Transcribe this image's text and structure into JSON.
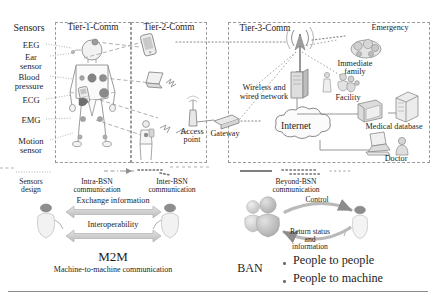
{
  "figure": {
    "regions": [
      {
        "id": "tier1",
        "label": "Tier-1-Comm"
      },
      {
        "id": "tier2",
        "label": "Tier-2-Comm"
      },
      {
        "id": "tier3",
        "label": "Tier-3-Comm"
      }
    ],
    "sensors": {
      "heading": "Sensors",
      "items": [
        {
          "name": "eeg",
          "label": "EEG"
        },
        {
          "name": "ear-sensor",
          "label": "Ear\nsensor"
        },
        {
          "name": "blood-pressure",
          "label": "Blood\npressure"
        },
        {
          "name": "ecg",
          "label": "ECG"
        },
        {
          "name": "emg",
          "label": "EMG"
        },
        {
          "name": "motion-sensor",
          "label": "Motion\nsensor"
        }
      ]
    },
    "nodes": {
      "access_point": "Access\npoint",
      "gateway": "Gateway",
      "wireless_wired_network": "Wireless and\nwired network",
      "internet": "Internet",
      "emergency": "Emergency",
      "immediate_family": "Immediate\nfamily",
      "facility": "Facility",
      "medical_database": "Medical database",
      "doctor": "Doctor"
    },
    "legend": [
      {
        "name": "sensors-design",
        "label": "Sensors\ndesign",
        "style": "dot-fine"
      },
      {
        "name": "intra-bsn",
        "label": "Intra-BSN\ncommunication",
        "style": "dash-dot"
      },
      {
        "name": "inter-bsn",
        "label": "Inter-BSN\ncommunication",
        "style": "dot-bold"
      },
      {
        "name": "beyond-bsn",
        "label": "Beyond-BSN\ncommunication",
        "style": "solid"
      }
    ],
    "m2m": {
      "arrow_top": "Exchange information",
      "arrow_bottom": "Interoperability",
      "title": "M2M",
      "subtitle": "Machine-to-machine communication"
    },
    "ban": {
      "arrow_top": "Control",
      "arrow_bottom": "Return status\nand\ninformation",
      "title": "BAN",
      "bullets": [
        "People to people",
        "People to machine"
      ]
    }
  },
  "colors": {
    "ink": "#1d1d1d",
    "dashed_border": "#9a9a9a",
    "art_stroke": "#8c8c8c",
    "art_fill": "#d9d9d9",
    "accent_dot": "#7d7d7d",
    "arrow_fill": "#d2d2d2",
    "rule": "#8d8d8d"
  }
}
